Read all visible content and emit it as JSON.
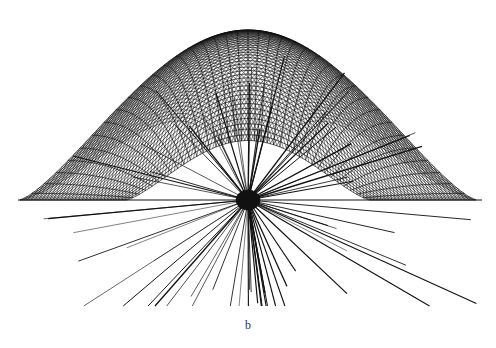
{
  "figure": {
    "panel_label": "b",
    "colors": {
      "ink": "#111111",
      "background": "#ffffff"
    },
    "geometry": {
      "baseline_y": 200,
      "baseline_x_range": [
        18,
        482
      ],
      "dome_apex": [
        248,
        30
      ],
      "dome_half_width": 228,
      "focal_point": [
        248,
        200
      ],
      "mesh_lines_per_family": 38,
      "ray_count": 70,
      "ray_max_length": 270
    }
  }
}
